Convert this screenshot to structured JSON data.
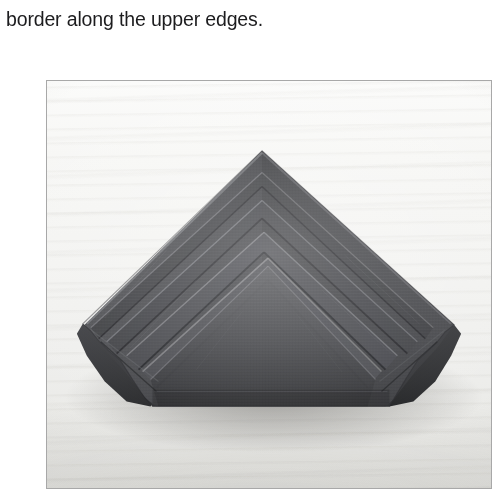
{
  "page": {
    "caption_text": "border along the upper edges.",
    "background_color": "#ffffff",
    "text_color": "#1c1c1e"
  },
  "photo": {
    "alt_description": "A dark folded cloth napkin arranged in a nested chevron fold, resting on a pale wood surface.",
    "border_color": "#a8a8a8",
    "surface_color": "#f3f3f1",
    "napkin_color": "#3f4043",
    "napkin_shadow_color": "#1b1c1e",
    "subject": "folded-napkin",
    "fold_count": 4
  }
}
